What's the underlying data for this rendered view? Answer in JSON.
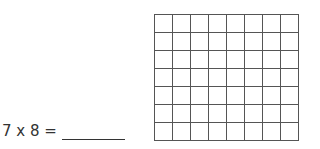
{
  "problem": {
    "expression": "7 x 8 =",
    "answer": ""
  },
  "grid": {
    "rows": 7,
    "cols": 8,
    "line_color": "#555555"
  }
}
